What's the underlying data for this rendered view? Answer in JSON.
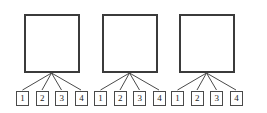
{
  "diagram": {
    "type": "tree-fan",
    "background_color": "#ffffff",
    "parent_border_color": "#3b3b3b",
    "leaf_border_color": "#4a4a4a",
    "connector_color": "#4a4a4a",
    "text_color": "#1c1c1c",
    "groups": [
      {
        "name": "group-1",
        "parent": {
          "label": "",
          "shape": "square"
        },
        "leaves": [
          {
            "label": "1"
          },
          {
            "label": "2"
          },
          {
            "label": "3"
          },
          {
            "label": "4"
          }
        ]
      },
      {
        "name": "group-2",
        "parent": {
          "label": "",
          "shape": "square"
        },
        "leaves": [
          {
            "label": "1"
          },
          {
            "label": "2"
          },
          {
            "label": "3"
          },
          {
            "label": "4"
          }
        ]
      },
      {
        "name": "group-3",
        "parent": {
          "label": "",
          "shape": "square"
        },
        "leaves": [
          {
            "label": "1"
          },
          {
            "label": "2"
          },
          {
            "label": "3"
          },
          {
            "label": "4"
          }
        ]
      }
    ]
  }
}
